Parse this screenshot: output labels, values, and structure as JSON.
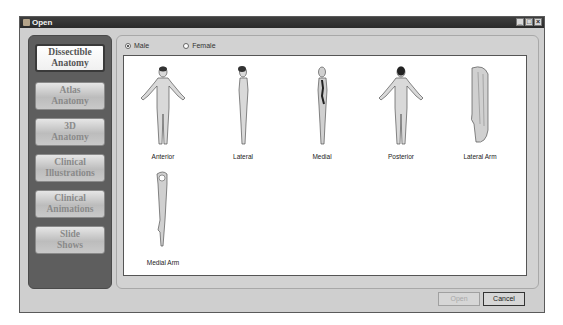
{
  "window": {
    "title": "Open",
    "controls": {
      "minimize": "_",
      "maximize": "□",
      "close": "×"
    }
  },
  "sidebar": {
    "items": [
      {
        "line1": "Dissectible",
        "line2": "Anatomy",
        "active": true
      },
      {
        "line1": "Atlas",
        "line2": "Anatomy",
        "active": false
      },
      {
        "line1": "3D",
        "line2": "Anatomy",
        "active": false
      },
      {
        "line1": "Clinical",
        "line2": "Illustrations",
        "active": false
      },
      {
        "line1": "Clinical",
        "line2": "Animations",
        "active": false
      },
      {
        "line1": "Slide",
        "line2": "Shows",
        "active": false
      }
    ]
  },
  "gender": {
    "options": [
      {
        "label": "Male",
        "checked": true
      },
      {
        "label": "Female",
        "checked": false
      }
    ]
  },
  "gallery": {
    "items": [
      {
        "label": "Anterior",
        "icon": "anterior-body-icon"
      },
      {
        "label": "Lateral",
        "icon": "lateral-body-icon"
      },
      {
        "label": "Medial",
        "icon": "medial-body-icon"
      },
      {
        "label": "Posterior",
        "icon": "posterior-body-icon"
      },
      {
        "label": "Lateral Arm",
        "icon": "lateral-arm-icon"
      },
      {
        "label": "Medial Arm",
        "icon": "medial-arm-icon"
      }
    ]
  },
  "footer": {
    "open_label": "Open",
    "cancel_label": "Cancel"
  }
}
